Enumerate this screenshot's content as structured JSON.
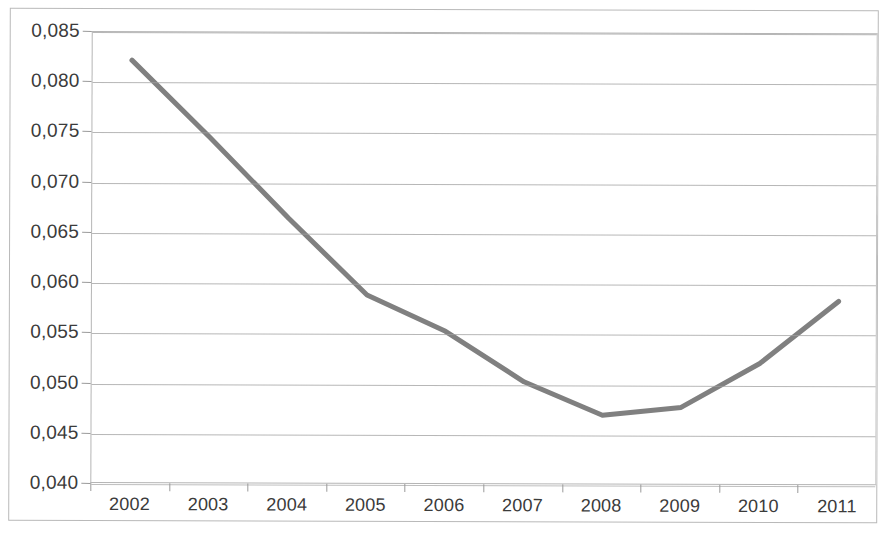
{
  "chart_data": {
    "type": "line",
    "title": "",
    "subtitle": "",
    "xlabel": "",
    "ylabel": "",
    "categories": [
      "2002",
      "2003",
      "2004",
      "2005",
      "2006",
      "2007",
      "2008",
      "2009",
      "2010",
      "2011"
    ],
    "values": [
      0.0822,
      0.0745,
      0.0665,
      0.0589,
      0.0553,
      0.0503,
      0.047,
      0.0478,
      0.0522,
      0.0584
    ],
    "series": [
      {
        "name": "",
        "values": [
          0.0822,
          0.0745,
          0.0665,
          0.0589,
          0.0553,
          0.0503,
          0.047,
          0.0478,
          0.0522,
          0.0584
        ]
      }
    ],
    "ylim": [
      0.04,
      0.085
    ],
    "ytick_step": 0.005,
    "ytick_labels": [
      "0,085",
      "0,080",
      "0,075",
      "0,070",
      "0,065",
      "0,060",
      "0,055",
      "0,050",
      "0,045",
      "0,040"
    ],
    "ytick_values": [
      0.085,
      0.08,
      0.075,
      0.07,
      0.065,
      0.06,
      0.055,
      0.05,
      0.045,
      0.04
    ],
    "decimal_separator": ",",
    "grid": true,
    "grid_axis": "y",
    "legend": false,
    "legend_position": "none",
    "markers": false,
    "annotations": [],
    "colors": {
      "series_line": "#808080",
      "gridline": "#9f9f9f",
      "axis": "#b5b5b5",
      "frame": "#b9b9b9",
      "text": "#3b3b3b",
      "background": "#ffffff"
    }
  }
}
